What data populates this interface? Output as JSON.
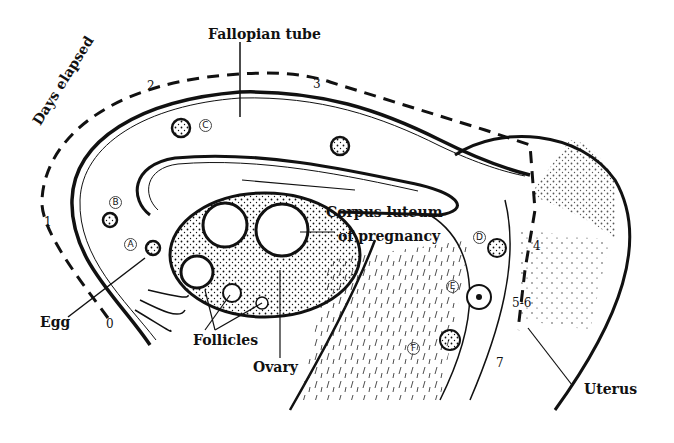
{
  "diagram": {
    "labels": {
      "fallopian_tube": "Fallopian tube",
      "days_elapsed": "Days elapsed",
      "corpus_luteum_1": "Corpus luteum",
      "corpus_luteum_2": "of pregnancy",
      "egg": "Egg",
      "follicles": "Follicles",
      "ovary": "Ovary",
      "uterus": "Uterus"
    },
    "day_markers": [
      "0",
      "1",
      "2",
      "3",
      "4",
      "5-6",
      "7"
    ],
    "stage_markers": [
      "A",
      "B",
      "C",
      "D",
      "E",
      "F"
    ],
    "colors": {
      "ink": "#111111",
      "paper": "#ffffff"
    }
  }
}
